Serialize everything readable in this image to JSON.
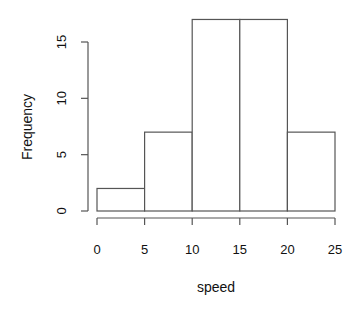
{
  "chart_data": {
    "type": "bar",
    "subtype": "histogram",
    "title": "",
    "xlabel": "speed",
    "ylabel": "Frequency",
    "bins": [
      {
        "from": 0,
        "to": 5,
        "count": 2
      },
      {
        "from": 5,
        "to": 10,
        "count": 7
      },
      {
        "from": 10,
        "to": 15,
        "count": 17
      },
      {
        "from": 15,
        "to": 20,
        "count": 17
      },
      {
        "from": 20,
        "to": 25,
        "count": 7
      }
    ],
    "categories": [
      "0-5",
      "5-10",
      "10-15",
      "15-20",
      "20-25"
    ],
    "values": [
      2,
      7,
      17,
      17,
      7
    ],
    "x_ticks": [
      0,
      5,
      10,
      15,
      20,
      25
    ],
    "y_ticks": [
      0,
      5,
      10,
      15
    ],
    "xlim": [
      0,
      25
    ],
    "ylim": [
      0,
      17
    ],
    "grid": false,
    "legend": null,
    "colors": {
      "bar_fill": "#ffffff",
      "bar_stroke": "#555555",
      "axis": "#555555",
      "text": "#111111"
    }
  }
}
